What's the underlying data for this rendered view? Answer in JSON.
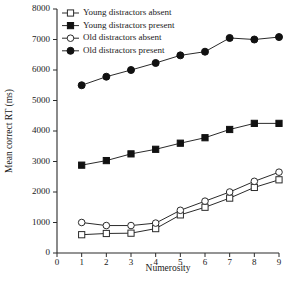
{
  "chart_data": {
    "type": "line",
    "title": "",
    "xlabel": "Numerosity",
    "ylabel": "Mean correct RT (ms)",
    "x": [
      1,
      2,
      3,
      4,
      5,
      6,
      7,
      8,
      9
    ],
    "xlim": [
      0,
      9
    ],
    "ylim": [
      0,
      8000
    ],
    "xticks": [
      0,
      1,
      2,
      3,
      4,
      5,
      6,
      7,
      8,
      9
    ],
    "yticks": [
      0,
      1000,
      2000,
      3000,
      4000,
      5000,
      6000,
      7000,
      8000
    ],
    "xtick_labels": [
      "0",
      "1",
      "2",
      "3",
      "4",
      "5",
      "6",
      "7",
      "8",
      "9"
    ],
    "ytick_labels": [
      "0",
      "1000",
      "2000",
      "3000",
      "4000",
      "5000",
      "6000",
      "7000",
      "8000"
    ],
    "grid": false,
    "legend_position": "top-left",
    "series": [
      {
        "name": "Young distractors absent",
        "marker": "open-square",
        "values": [
          600,
          640,
          650,
          800,
          1250,
          1500,
          1800,
          2150,
          2400
        ]
      },
      {
        "name": "Young distractors present",
        "marker": "filled-square",
        "values": [
          2880,
          3030,
          3250,
          3400,
          3600,
          3780,
          4050,
          4250,
          4250
        ]
      },
      {
        "name": "Old distractors absent",
        "marker": "open-circle",
        "values": [
          1000,
          900,
          900,
          980,
          1400,
          1700,
          2000,
          2350,
          2650
        ]
      },
      {
        "name": "Old distractors present",
        "marker": "filled-circle",
        "values": [
          5500,
          5780,
          6000,
          6230,
          6480,
          6600,
          7050,
          7000,
          7080
        ]
      }
    ]
  }
}
